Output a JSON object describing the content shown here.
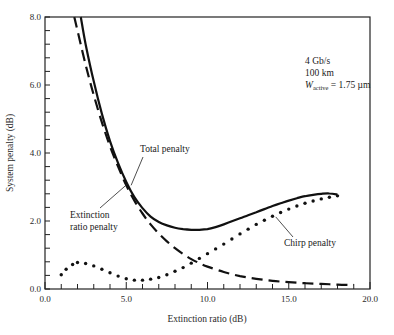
{
  "chart_data": {
    "type": "line",
    "title": "",
    "xlabel": "Extinction ratio (dB)",
    "ylabel": "System penalty (dB)",
    "xlim": [
      0,
      20
    ],
    "ylim": [
      0,
      8
    ],
    "xticks": [
      0,
      5,
      10,
      15,
      20
    ],
    "xtick_labels": [
      "0.0",
      "5.0",
      "10.0",
      "15.0",
      "20.0"
    ],
    "yticks": [
      0,
      2,
      4,
      6,
      8
    ],
    "ytick_labels": [
      "0.0",
      "2.0",
      "4.0",
      "6.0",
      "8.0"
    ],
    "x_minor_step": 1,
    "y_minor_step": 0.4,
    "grid": false,
    "legend": "none (inline labels)",
    "parameters": [
      "4 Gb/s",
      "100 km",
      "W_active = 1.75 µm"
    ],
    "series": [
      {
        "name": "Total penalty",
        "style": "solid",
        "x": [
          2.2,
          2.5,
          3.0,
          3.5,
          4.0,
          4.5,
          5.0,
          5.5,
          6.0,
          6.5,
          7.0,
          7.5,
          8.0,
          8.5,
          9.0,
          9.5,
          10.0,
          10.5,
          11.0,
          11.5,
          12.0,
          12.5,
          13.0,
          13.5,
          14.0,
          14.5,
          15.0,
          15.5,
          16.0,
          16.5,
          17.0,
          17.5,
          18.0
        ],
        "y": [
          8.0,
          7.2,
          6.1,
          5.15,
          4.35,
          3.7,
          3.15,
          2.7,
          2.38,
          2.13,
          1.97,
          1.87,
          1.8,
          1.76,
          1.74,
          1.74,
          1.76,
          1.82,
          1.9,
          1.99,
          2.08,
          2.17,
          2.26,
          2.35,
          2.44,
          2.52,
          2.6,
          2.67,
          2.73,
          2.77,
          2.8,
          2.81,
          2.78
        ]
      },
      {
        "name": "Extinction ratio penalty",
        "style": "dashed",
        "x": [
          1.8,
          2.0,
          2.5,
          3.0,
          3.5,
          4.0,
          4.5,
          5.0,
          5.5,
          6.0,
          6.5,
          7.0,
          7.5,
          8.0,
          8.5,
          9.0,
          9.5,
          10.0,
          11.0,
          12.0,
          13.0,
          14.0,
          15.0,
          16.0,
          17.0,
          18.0,
          19.0
        ],
        "y": [
          8.0,
          7.6,
          6.6,
          5.7,
          4.9,
          4.2,
          3.6,
          3.05,
          2.6,
          2.22,
          1.9,
          1.63,
          1.4,
          1.2,
          1.03,
          0.88,
          0.76,
          0.66,
          0.5,
          0.38,
          0.3,
          0.24,
          0.2,
          0.17,
          0.15,
          0.13,
          0.12
        ]
      },
      {
        "name": "Chirp penalty",
        "style": "dotted",
        "x": [
          1.0,
          1.3,
          1.7,
          2.0,
          2.5,
          3.0,
          3.5,
          4.0,
          4.5,
          5.0,
          5.5,
          6.0,
          6.5,
          7.0,
          7.5,
          8.0,
          8.5,
          9.0,
          9.5,
          10.0,
          10.5,
          11.0,
          11.5,
          12.0,
          12.5,
          13.0,
          13.5,
          14.0,
          14.5,
          15.0,
          15.5,
          16.0,
          16.5,
          17.0,
          17.5,
          18.0
        ],
        "y": [
          0.42,
          0.58,
          0.72,
          0.78,
          0.75,
          0.68,
          0.58,
          0.48,
          0.38,
          0.3,
          0.26,
          0.26,
          0.29,
          0.34,
          0.42,
          0.52,
          0.63,
          0.76,
          0.9,
          1.04,
          1.18,
          1.32,
          1.47,
          1.62,
          1.76,
          1.9,
          2.02,
          2.14,
          2.25,
          2.35,
          2.44,
          2.52,
          2.59,
          2.65,
          2.7,
          2.74
        ]
      }
    ],
    "annotations": [
      {
        "text": "Total penalty",
        "label_x": 10.3,
        "label_y": 4.0,
        "arrow_to": [
          5.3,
          3.05
        ]
      },
      {
        "text": "Extinction\nratio penalty",
        "label_x": 1.6,
        "label_y": 2.35,
        "arrow_to": [
          5.1,
          3.1
        ]
      },
      {
        "text": "Chirp penalty",
        "label_x": 14.7,
        "label_y": 1.35,
        "arrow_to": [
          14.2,
          2.12
        ]
      }
    ]
  },
  "labels": {
    "param_rate": "4 Gb/s",
    "param_distance": "100 km",
    "param_w_symbol": "W",
    "param_w_sub": "active",
    "param_w_value": " = 1.75 µm",
    "total_penalty": "Total penalty",
    "ext_line1": "Extinction",
    "ext_line2": "ratio penalty",
    "chirp_penalty": "Chirp penalty",
    "xlabel": "Extinction ratio (dB)",
    "ylabel": "System penalty (dB)"
  }
}
